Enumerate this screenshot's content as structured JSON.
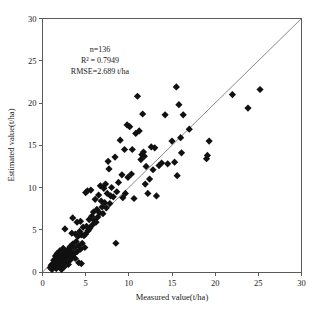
{
  "chart_data": {
    "type": "scatter",
    "title": "",
    "xlabel": "Measured value(t/ha)",
    "ylabel": "Estimated value(t/ha)",
    "xlim": [
      0,
      30
    ],
    "ylim": [
      0,
      30
    ],
    "xticks": [
      0,
      5,
      10,
      15,
      20,
      25,
      30
    ],
    "yticks": [
      0,
      5,
      10,
      15,
      20,
      25,
      30
    ],
    "xtick_labels": [
      "0",
      "5",
      "10",
      "15",
      "20",
      "25",
      "30"
    ],
    "ytick_labels": [
      "0",
      "5",
      "10",
      "15",
      "20",
      "25",
      "30"
    ],
    "grid": false,
    "legend": null,
    "reference_line": {
      "name": "1:1 line",
      "from": [
        0,
        0
      ],
      "to": [
        30,
        30
      ]
    },
    "marker": {
      "shape": "diamond",
      "color": "#111111",
      "size": 3.6
    },
    "annotations": [
      "n=136",
      "R² = 0.7949",
      "RMSE=2.689 t/ha"
    ],
    "n": 136,
    "r_squared": 0.7949,
    "rmse": 2.689,
    "rmse_units": "t/ha",
    "series": [
      {
        "name": "samples",
        "points": [
          [
            0.9,
            0.5
          ],
          [
            1.0,
            0.8
          ],
          [
            1.1,
            0.3
          ],
          [
            1.2,
            1.0
          ],
          [
            1.2,
            0.5
          ],
          [
            1.3,
            1.4
          ],
          [
            1.4,
            0.7
          ],
          [
            1.5,
            1.1
          ],
          [
            1.5,
            1.9
          ],
          [
            1.6,
            0.4
          ],
          [
            1.7,
            1.5
          ],
          [
            1.7,
            2.2
          ],
          [
            1.8,
            0.9
          ],
          [
            1.9,
            1.3
          ],
          [
            1.9,
            1.8
          ],
          [
            2.0,
            0.6
          ],
          [
            2.0,
            2.5
          ],
          [
            2.1,
            1.2
          ],
          [
            2.2,
            1.7
          ],
          [
            2.2,
            0.3
          ],
          [
            2.3,
            2.0
          ],
          [
            2.4,
            1.0
          ],
          [
            2.4,
            2.8
          ],
          [
            2.5,
            1.5
          ],
          [
            2.5,
            0.6
          ],
          [
            2.6,
            2.3
          ],
          [
            2.6,
            5.1
          ],
          [
            2.7,
            1.9
          ],
          [
            2.8,
            1.3
          ],
          [
            2.9,
            2.6
          ],
          [
            3.0,
            1.7
          ],
          [
            3.0,
            0.9
          ],
          [
            3.1,
            2.2
          ],
          [
            3.2,
            3.0
          ],
          [
            3.2,
            1.4
          ],
          [
            3.3,
            2.5
          ],
          [
            3.4,
            1.8
          ],
          [
            3.4,
            4.6
          ],
          [
            3.5,
            3.3
          ],
          [
            3.5,
            6.4
          ],
          [
            3.6,
            2.1
          ],
          [
            3.7,
            2.9
          ],
          [
            3.8,
            1.6
          ],
          [
            3.8,
            4.5
          ],
          [
            3.9,
            3.6
          ],
          [
            4.0,
            2.4
          ],
          [
            4.0,
            5.9
          ],
          [
            4.1,
            4.2
          ],
          [
            4.2,
            1.1
          ],
          [
            4.2,
            3.1
          ],
          [
            4.3,
            4.8
          ],
          [
            4.4,
            2.7
          ],
          [
            4.4,
            6.0
          ],
          [
            4.5,
            4.4
          ],
          [
            4.5,
            1.0
          ],
          [
            4.6,
            3.4
          ],
          [
            4.7,
            5.3
          ],
          [
            4.8,
            4.3
          ],
          [
            4.9,
            2.9
          ],
          [
            5.0,
            9.4
          ],
          [
            5.0,
            4.5
          ],
          [
            5.1,
            5.4
          ],
          [
            5.2,
            9.6
          ],
          [
            5.3,
            4.9
          ],
          [
            5.4,
            6.2
          ],
          [
            5.5,
            5.2
          ],
          [
            5.6,
            9.7
          ],
          [
            5.7,
            6.6
          ],
          [
            5.8,
            5.6
          ],
          [
            5.9,
            7.1
          ],
          [
            6.0,
            6.1
          ],
          [
            6.1,
            8.6
          ],
          [
            6.2,
            5.9
          ],
          [
            6.3,
            7.4
          ],
          [
            6.4,
            6.5
          ],
          [
            6.5,
            9.1
          ],
          [
            6.6,
            7.0
          ],
          [
            6.7,
            10.2
          ],
          [
            6.8,
            8.4
          ],
          [
            6.9,
            7.7
          ],
          [
            7.0,
            6.9
          ],
          [
            7.1,
            9.9
          ],
          [
            7.2,
            8.2
          ],
          [
            7.3,
            10.4
          ],
          [
            7.4,
            7.6
          ],
          [
            7.5,
            9.3
          ],
          [
            7.6,
            13.1
          ],
          [
            7.7,
            12.2
          ],
          [
            7.8,
            8.1
          ],
          [
            7.9,
            9.0
          ],
          [
            8.0,
            10.0
          ],
          [
            8.2,
            8.9
          ],
          [
            8.4,
            13.6
          ],
          [
            8.5,
            3.4
          ],
          [
            8.6,
            9.5
          ],
          [
            8.8,
            10.6
          ],
          [
            9.0,
            15.6
          ],
          [
            9.2,
            11.5
          ],
          [
            9.3,
            8.8
          ],
          [
            9.5,
            14.5
          ],
          [
            9.6,
            9.3
          ],
          [
            9.8,
            17.4
          ],
          [
            9.9,
            11.2
          ],
          [
            10.1,
            17.2
          ],
          [
            10.3,
            11.6
          ],
          [
            10.4,
            14.5
          ],
          [
            10.6,
            8.7
          ],
          [
            10.8,
            16.4
          ],
          [
            11.0,
            20.8
          ],
          [
            11.2,
            16.7
          ],
          [
            11.4,
            13.3
          ],
          [
            11.5,
            13.9
          ],
          [
            11.6,
            18.7
          ],
          [
            11.7,
            14.2
          ],
          [
            11.8,
            13.7
          ],
          [
            11.9,
            10.4
          ],
          [
            12.0,
            12.5
          ],
          [
            12.2,
            9.3
          ],
          [
            12.4,
            11.0
          ],
          [
            12.6,
            14.8
          ],
          [
            12.8,
            12.1
          ],
          [
            13.0,
            14.7
          ],
          [
            13.2,
            9.0
          ],
          [
            13.5,
            12.6
          ],
          [
            13.8,
            12.9
          ],
          [
            14.2,
            18.6
          ],
          [
            14.5,
            12.8
          ],
          [
            15.0,
            15.5
          ],
          [
            15.3,
            13.0
          ],
          [
            15.5,
            21.9
          ],
          [
            15.6,
            11.4
          ],
          [
            15.8,
            19.8
          ],
          [
            16.0,
            15.9
          ],
          [
            16.1,
            14.1
          ],
          [
            16.3,
            18.6
          ],
          [
            17.0,
            16.9
          ],
          [
            19.0,
            13.4
          ],
          [
            19.1,
            13.8
          ],
          [
            19.3,
            15.5
          ],
          [
            22.0,
            21.0
          ],
          [
            23.8,
            19.4
          ],
          [
            25.2,
            21.6
          ]
        ]
      }
    ]
  },
  "axis": {
    "x_title": "Measured value(t/ha)",
    "y_title": "Estimated value(t/ha)"
  },
  "stats": {
    "line1": "n=136",
    "line2": "R² = 0.7949",
    "line3": "RMSE=2.689 t/ha"
  }
}
